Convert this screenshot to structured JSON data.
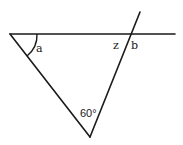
{
  "diagram": {
    "labels": {
      "angle_a": "a",
      "angle_z": "z",
      "angle_b": "b",
      "angle_bottom": "60°"
    },
    "angles": {
      "bottom_vertex_degrees": 60
    },
    "colors": {
      "stroke": "#1a1a1a",
      "background": "#ffffff"
    }
  }
}
